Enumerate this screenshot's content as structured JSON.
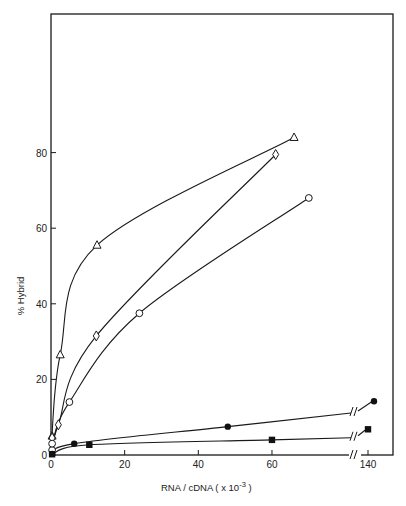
{
  "chart_data": {
    "type": "line",
    "title": "",
    "xlabel": "RNA / cDNA ( x 10^-3 )",
    "xlabel_main": "RNA / cDNA  ( x 10",
    "xlabel_exp": "-3",
    "xlabel_close": " )",
    "ylabel": "% Hybrid",
    "xlim": [
      0,
      146
    ],
    "ylim": [
      0,
      100
    ],
    "x_axis_break": {
      "after": 60,
      "resume": 140
    },
    "xticks": [
      0,
      20,
      40,
      60,
      140
    ],
    "yticks": [
      0,
      20,
      40,
      60,
      80
    ],
    "grid": false,
    "legend": null,
    "series": [
      {
        "name": "open-triangle",
        "marker": "triangle-open",
        "x": [
          0.3,
          2.5,
          12.5,
          66
        ],
        "y": [
          5,
          26.5,
          55.5,
          84
        ]
      },
      {
        "name": "open-diamond",
        "marker": "diamond-open",
        "x": [
          0.3,
          2,
          12.3,
          61
        ],
        "y": [
          4.5,
          8,
          31.5,
          79.5
        ]
      },
      {
        "name": "open-circle",
        "marker": "circle-open",
        "x": [
          0.3,
          0.3,
          5,
          24,
          70
        ],
        "y": [
          1.3,
          3,
          14,
          37.5,
          68
        ]
      },
      {
        "name": "filled-circle",
        "marker": "circle-filled",
        "x": [
          0.3,
          6.3,
          48,
          142
        ],
        "y": [
          0.3,
          3,
          7.5,
          14.2
        ]
      },
      {
        "name": "filled-square",
        "marker": "square-filled",
        "x": [
          0.3,
          10.4,
          60,
          140
        ],
        "y": [
          0.2,
          2.7,
          4,
          6.8
        ]
      }
    ]
  }
}
